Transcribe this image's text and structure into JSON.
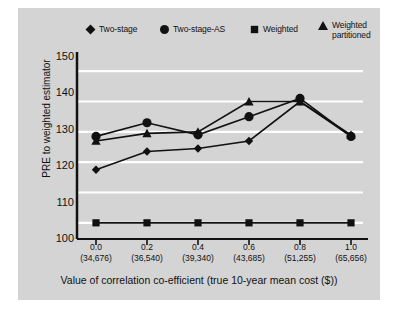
{
  "figure": {
    "background_color": "#d4d4d4",
    "page_background": "#ffffff",
    "series_color": "#111111",
    "gridline_color": "#ffffff"
  },
  "legend": {
    "items": [
      {
        "marker": "diamond-marker-icon",
        "label": "Two-stage"
      },
      {
        "marker": "circle-marker-icon",
        "label": "Two-stage-AS"
      },
      {
        "marker": "square-marker-icon",
        "label": "Weighted"
      },
      {
        "marker": "triangle-marker-icon",
        "label": "Weighted\npartitioned"
      }
    ]
  },
  "axes": {
    "y_title": "PRE to weighted estimator",
    "y_ticks": [
      "100",
      "110",
      "120",
      "130",
      "140",
      "150"
    ],
    "x_title": "Value of correlation co-efficient (true 10-year mean cost ($))",
    "x_ticks": [
      {
        "value": "0.0",
        "cost": "(34,676)"
      },
      {
        "value": "0.2",
        "cost": "(36,540)"
      },
      {
        "value": "0.4",
        "cost": "(39,340)"
      },
      {
        "value": "0.6",
        "cost": "(43,685)"
      },
      {
        "value": "0.8",
        "cost": "(51,255)"
      },
      {
        "value": "1.0",
        "cost": "(65,656)"
      }
    ]
  },
  "chart_data": {
    "type": "line",
    "title": "",
    "xlabel": "Value of correlation co-efficient (true 10-year mean cost ($))",
    "ylabel": "PRE to weighted estimator",
    "x": [
      0.0,
      0.2,
      0.4,
      0.6,
      0.8,
      1.0
    ],
    "x_tick_labels": [
      "0.0",
      "0.2",
      "0.4",
      "0.6",
      "0.8",
      "1.0"
    ],
    "x_secondary_labels": [
      "(34,676)",
      "(36,540)",
      "(39,340)",
      "(43,685)",
      "(51,255)",
      "(65,656)"
    ],
    "ylim": [
      95,
      155
    ],
    "yticks": [
      100,
      110,
      120,
      130,
      140,
      150
    ],
    "grid": "horizontal",
    "legend_position": "top",
    "series": [
      {
        "name": "Two-stage",
        "marker": "diamond",
        "values": [
          117.5,
          123.5,
          124.5,
          127.0,
          140.0,
          128.5
        ]
      },
      {
        "name": "Two-stage-AS",
        "marker": "circle",
        "values": [
          128.5,
          133.0,
          129.0,
          135.0,
          141.0,
          128.5
        ]
      },
      {
        "name": "Weighted",
        "marker": "square",
        "values": [
          100.0,
          100.0,
          100.0,
          100.0,
          100.0,
          100.0
        ]
      },
      {
        "name": "Weighted partitioned",
        "marker": "triangle",
        "values": [
          127.0,
          129.5,
          130.0,
          140.0,
          140.0,
          129.0
        ]
      }
    ]
  }
}
